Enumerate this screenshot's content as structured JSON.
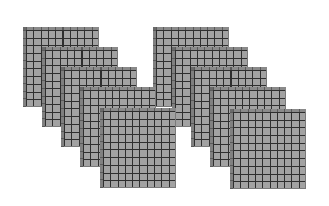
{
  "figure": {
    "groups": [
      {
        "name": "left-group",
        "plates": [
          {
            "x": 23,
            "y": 27
          },
          {
            "x": 42,
            "y": 47
          },
          {
            "x": 61,
            "y": 67
          },
          {
            "x": 80,
            "y": 87
          },
          {
            "x": 100,
            "y": 108
          }
        ]
      },
      {
        "name": "right-group",
        "plates": [
          {
            "x": 153,
            "y": 27
          },
          {
            "x": 172,
            "y": 47
          },
          {
            "x": 191,
            "y": 67
          },
          {
            "x": 210,
            "y": 87
          },
          {
            "x": 230,
            "y": 109
          }
        ]
      }
    ],
    "grid": {
      "rows": 10,
      "cols": 10
    },
    "colors": {
      "cell": "#a2a2a2",
      "grid_line": "#2e2e2e",
      "bevel": "#808080",
      "background": "#ffffff"
    }
  }
}
